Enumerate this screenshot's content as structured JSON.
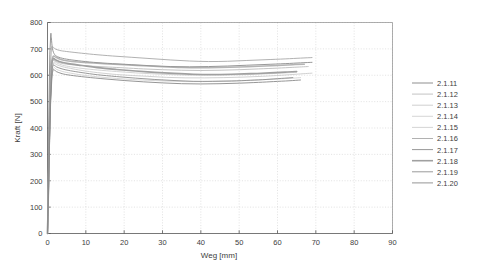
{
  "chart_data": {
    "type": "line",
    "title": "",
    "xlabel": "Weg [mm]",
    "ylabel": "Kraft [N]",
    "xlim": [
      0,
      90
    ],
    "ylim": [
      0,
      800
    ],
    "xticks": [
      0,
      10,
      20,
      30,
      40,
      50,
      60,
      70,
      80,
      90
    ],
    "yticks": [
      0,
      100,
      200,
      300,
      400,
      500,
      600,
      700,
      800
    ],
    "grid": true,
    "legend_position": "right-outside",
    "background": "#ffffff",
    "series": [
      {
        "name": "2.1.11",
        "color": "#b4b4b4",
        "width": 1.5,
        "x": [
          0,
          0.25,
          0.5,
          0.8,
          1.1,
          1.5,
          2.2,
          3.5,
          5,
          8,
          12,
          16,
          20,
          25,
          30,
          35,
          40,
          45,
          50,
          55,
          60,
          64,
          67
        ],
        "y": [
          0,
          180,
          390,
          560,
          648,
          672,
          668,
          660,
          655,
          650,
          646,
          643,
          640,
          636,
          632,
          629,
          628,
          629,
          631,
          634,
          637,
          640,
          642
        ]
      },
      {
        "name": "2.1.12",
        "color": "#bcbcbc",
        "width": 0.9,
        "x": [
          0,
          0.25,
          0.5,
          0.8,
          1.1,
          1.5,
          2.2,
          3.5,
          5,
          8,
          12,
          16,
          20,
          25,
          30,
          35,
          40,
          45,
          50,
          55,
          60,
          64,
          68
        ],
        "y": [
          0,
          170,
          370,
          540,
          630,
          656,
          652,
          646,
          642,
          638,
          634,
          631,
          628,
          624,
          621,
          619,
          618,
          619,
          621,
          624,
          627,
          630,
          633
        ]
      },
      {
        "name": "2.1.13",
        "color": "#c4c4c4",
        "width": 0.8,
        "x": [
          0,
          0.25,
          0.5,
          0.8,
          1.1,
          1.6,
          2.4,
          4,
          6,
          9,
          13,
          17,
          21,
          26,
          31,
          36,
          41,
          46,
          51,
          56,
          61,
          65,
          69
        ],
        "y": [
          0,
          160,
          350,
          520,
          612,
          645,
          640,
          632,
          626,
          618,
          610,
          604,
          600,
          596,
          592,
          590,
          590,
          591,
          593,
          596,
          600,
          604,
          608
        ]
      },
      {
        "name": "2.1.14",
        "color": "#cccccc",
        "width": 0.8,
        "x": [
          0,
          0.25,
          0.5,
          0.8,
          1.1,
          1.6,
          2.4,
          4,
          6,
          9,
          13,
          17,
          21,
          26,
          31,
          36,
          41,
          46,
          51,
          56,
          60,
          64,
          66
        ],
        "y": [
          0,
          150,
          330,
          500,
          592,
          628,
          622,
          614,
          608,
          601,
          594,
          589,
          585,
          581,
          578,
          576,
          576,
          578,
          580,
          583,
          586,
          589,
          591
        ]
      },
      {
        "name": "2.1.15",
        "color": "#c9c9c9",
        "width": 0.8,
        "x": [
          0,
          0.25,
          0.5,
          0.8,
          1.2,
          1.7,
          2.6,
          4,
          6,
          9,
          13,
          18,
          23,
          28,
          33,
          38,
          43,
          48,
          53,
          58,
          62,
          65
        ],
        "y": [
          0,
          165,
          360,
          530,
          622,
          650,
          645,
          638,
          632,
          626,
          620,
          614,
          609,
          605,
          602,
          600,
          600,
          601,
          603,
          606,
          609,
          611
        ]
      },
      {
        "name": "2.1.16",
        "color": "#a8a8a8",
        "width": 0.9,
        "x": [
          0,
          0.2,
          0.45,
          0.7,
          1.0,
          1.4,
          2.0,
          3.2,
          5,
          8,
          12,
          17,
          22,
          27,
          32,
          37,
          42,
          47,
          52,
          57,
          62,
          66,
          69
        ],
        "y": [
          0,
          200,
          430,
          610,
          700,
          707,
          700,
          694,
          690,
          685,
          679,
          673,
          668,
          663,
          658,
          654,
          652,
          653,
          656,
          659,
          662,
          665,
          667
        ]
      },
      {
        "name": "2.1.17",
        "color": "#989898",
        "width": 1.0,
        "x": [
          0,
          0.2,
          0.4,
          0.6,
          0.85,
          1.0,
          1.3,
          1.9,
          3,
          5,
          8,
          12,
          17,
          22,
          27,
          32,
          37,
          42,
          47,
          52,
          57,
          62,
          66,
          69
        ],
        "y": [
          0,
          230,
          500,
          680,
          756,
          742,
          700,
          678,
          668,
          661,
          655,
          649,
          644,
          640,
          636,
          633,
          632,
          633,
          635,
          638,
          641,
          644,
          647,
          649
        ]
      },
      {
        "name": "2.1.18",
        "color": "#a0a0a0",
        "width": 1.6,
        "x": [
          0,
          0.25,
          0.5,
          0.8,
          1.1,
          1.5,
          2.2,
          3.5,
          5.5,
          9,
          13,
          18,
          23,
          28,
          33,
          38,
          43,
          48,
          53,
          58,
          62,
          65
        ],
        "y": [
          0,
          175,
          385,
          555,
          640,
          663,
          658,
          650,
          644,
          637,
          629,
          622,
          616,
          611,
          607,
          604,
          603,
          604,
          606,
          609,
          612,
          614
        ]
      },
      {
        "name": "2.1.19",
        "color": "#8e8e8e",
        "width": 0.9,
        "x": [
          0,
          0.25,
          0.5,
          0.8,
          1.1,
          1.5,
          2.3,
          3.8,
          6,
          9,
          13,
          18,
          23,
          28,
          33,
          38,
          43,
          48,
          53,
          57,
          61,
          64
        ],
        "y": [
          0,
          155,
          345,
          515,
          602,
          638,
          632,
          624,
          617,
          610,
          602,
          595,
          589,
          584,
          580,
          577,
          577,
          578,
          581,
          584,
          588,
          591
        ]
      },
      {
        "name": "2.1.20",
        "color": "#8a8a8a",
        "width": 0.9,
        "x": [
          0,
          0.25,
          0.5,
          0.8,
          1.1,
          1.5,
          2.3,
          3.8,
          6,
          10,
          15,
          20,
          25,
          30,
          35,
          40,
          45,
          50,
          55,
          59,
          63,
          66
        ],
        "y": [
          0,
          145,
          320,
          490,
          580,
          620,
          614,
          606,
          600,
          593,
          586,
          580,
          575,
          571,
          568,
          567,
          568,
          570,
          573,
          576,
          579,
          582
        ]
      }
    ]
  },
  "legend": {
    "entries": [
      {
        "label": "2.1.11"
      },
      {
        "label": "2.1.12"
      },
      {
        "label": "2.1.13"
      },
      {
        "label": "2.1.14"
      },
      {
        "label": "2.1.15"
      },
      {
        "label": "2.1.16"
      },
      {
        "label": "2.1.17"
      },
      {
        "label": "2.1.18"
      },
      {
        "label": "2.1.19"
      },
      {
        "label": "2.1.20"
      }
    ]
  },
  "axes": {
    "x_title": "Weg [mm]",
    "y_title": "Kraft [N]",
    "x_tick_labels": [
      "0",
      "10",
      "20",
      "30",
      "40",
      "50",
      "60",
      "70",
      "80",
      "90"
    ],
    "y_tick_labels": [
      "0",
      "100",
      "200",
      "300",
      "400",
      "500",
      "600",
      "700",
      "800"
    ]
  }
}
